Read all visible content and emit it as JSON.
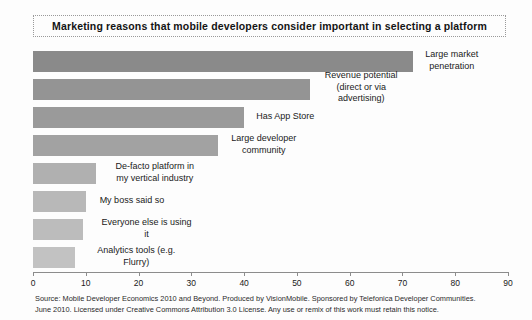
{
  "chart_data": {
    "type": "bar",
    "orientation": "horizontal",
    "title": "Marketing reasons that mobile developers consider important in selecting a platform",
    "xlabel": "",
    "ylabel": "",
    "xlim": [
      0,
      90
    ],
    "grid": false,
    "legend": "none",
    "tick_labels": [
      "0",
      "10",
      "20",
      "30",
      "40",
      "50",
      "60",
      "70",
      "80",
      "90"
    ],
    "tick_values": [
      0,
      10,
      20,
      30,
      40,
      50,
      60,
      70,
      80,
      90
    ],
    "categories": [
      "Large market penetration",
      "Revenue potential (direct or via advertising)",
      "Has App Store",
      "Large developer community",
      "De-facto platform in my vertical industry",
      "My boss said so",
      "Everyone else is using it",
      "Analytics tools (e.g. Flurry)"
    ],
    "values": [
      72,
      52.5,
      40,
      35,
      12,
      10,
      9.5,
      8
    ],
    "bar_colors": [
      "#8a8a8a",
      "#949494",
      "#9a9a9a",
      "#a2a2a2",
      "#b0b0b0",
      "#b8b8b8",
      "#bcbcbc",
      "#c2c2c2"
    ],
    "bars": [
      {
        "label_line_1": "Large market",
        "label_line_2": "penetration",
        "value": 72
      },
      {
        "label_line_1": "Revenue potential",
        "label_line_2": "(direct or via",
        "label_line_3": "advertising)",
        "value": 52.5
      },
      {
        "label_line_1": "Has App Store",
        "label_line_2": "",
        "value": 40
      },
      {
        "label_line_1": "Large developer",
        "label_line_2": "community",
        "value": 35
      },
      {
        "label_line_1": "De-facto platform in",
        "label_line_2": "my vertical industry",
        "value": 12
      },
      {
        "label_line_1": "My boss said so",
        "label_line_2": "",
        "value": 10
      },
      {
        "label_line_1": "Everyone else is using",
        "label_line_2": "it",
        "value": 9.5
      },
      {
        "label_line_1": "Analytics tools (e.g.",
        "label_line_2": "Flurry)",
        "value": 8
      }
    ]
  },
  "footer": {
    "line_1": "Source: Mobile Developer Economics 2010 and Beyond. Produced by VisionMobile. Sponsored by Telefonica Developer Communities.",
    "line_2": "June 2010. Licensed under Creative Commons Attribution 3.0 License. Any use or remix of this work must retain this notice."
  }
}
